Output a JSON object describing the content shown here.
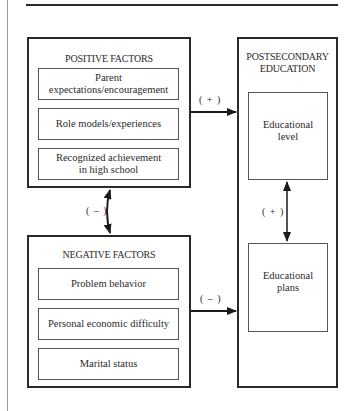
{
  "diagram": {
    "positive_factors": {
      "title": "POSITIVE FACTORS",
      "items": [
        {
          "line1": "Parent",
          "line2": "expectations/encouragement"
        },
        {
          "line1": "Role models/experiences",
          "line2": ""
        },
        {
          "line1": "Recognized achievement",
          "line2": "in high school"
        }
      ]
    },
    "negative_factors": {
      "title": "NEGATIVE FACTORS",
      "items": [
        {
          "line1": "Problem behavior"
        },
        {
          "line1": "Personal economic difficulty"
        },
        {
          "line1": "Marital status"
        }
      ]
    },
    "postsecondary": {
      "title_line1": "POSTSECONDARY",
      "title_line2": "EDUCATION",
      "items": [
        {
          "line1": "Educational",
          "line2": "level"
        },
        {
          "line1": "Educational",
          "line2": "plans"
        }
      ]
    },
    "relations": {
      "positive_to_postsecondary": "( + )",
      "negative_to_postsecondary": "( – )",
      "positive_negative": "( – )",
      "level_plans": "( + )"
    }
  }
}
